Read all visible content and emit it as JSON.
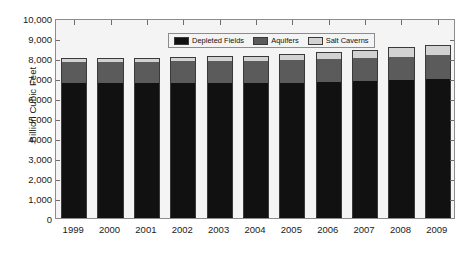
{
  "chart_data": {
    "type": "bar",
    "stacked": true,
    "title": "",
    "subtitle": "",
    "xlabel": "",
    "ylabel": "Billion Cubic Feet",
    "categories": [
      "1999",
      "2000",
      "2001",
      "2002",
      "2003",
      "2004",
      "2005",
      "2006",
      "2007",
      "2008",
      "2009"
    ],
    "series": [
      {
        "name": "Depleted Fields",
        "color": "#111111",
        "values": [
          6730,
          6740,
          6740,
          6760,
          6760,
          6760,
          6770,
          6790,
          6830,
          6880,
          6960
        ]
      },
      {
        "name": "Aquifers",
        "color": "#5b5b5b",
        "values": [
          1080,
          1080,
          1060,
          1070,
          1080,
          1090,
          1140,
          1140,
          1150,
          1180,
          1180
        ]
      },
      {
        "name": "Salt Caverns",
        "color": "#d2d2d2",
        "values": [
          180,
          190,
          200,
          220,
          240,
          270,
          300,
          350,
          410,
          480,
          530
        ]
      }
    ],
    "totals": [
      7990,
      8010,
      8000,
      8050,
      8080,
      8120,
      8210,
      8280,
      8390,
      8540,
      8670
    ],
    "ylim": [
      0,
      10000
    ],
    "ytick_values": [
      0,
      1000,
      2000,
      3000,
      4000,
      5000,
      6000,
      7000,
      8000,
      9000,
      10000
    ],
    "ytick_labels": [
      "0",
      "1,000",
      "2,000",
      "3,000",
      "4,000",
      "5,000",
      "6,000",
      "7,000",
      "8,000",
      "9,000",
      "10,000"
    ],
    "grid": false,
    "legend_position": "top-center",
    "legend_entries": [
      "Depleted Fields",
      "Aquifers",
      "Salt Caverns"
    ]
  },
  "legend": {
    "item0": "Depleted Fields",
    "item1": "Aquifers",
    "item2": "Salt Caverns"
  },
  "axis": {
    "y_title": "Billion Cubic Feet"
  },
  "colors": {
    "depleted_fields": "#111111",
    "aquifers": "#5b5b5b",
    "salt_caverns": "#d2d2d2",
    "plot_background": "#f4f4f4",
    "frame": "#8c8c8c",
    "page_background": "#ffffff"
  }
}
